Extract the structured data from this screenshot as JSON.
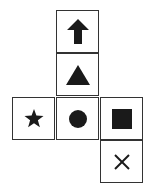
{
  "diagram": {
    "type": "cube-net",
    "cells": [
      {
        "row": 0,
        "col": 1,
        "symbol": "up-arrow"
      },
      {
        "row": 1,
        "col": 1,
        "symbol": "triangle"
      },
      {
        "row": 2,
        "col": 0,
        "symbol": "star"
      },
      {
        "row": 2,
        "col": 1,
        "symbol": "circle"
      },
      {
        "row": 2,
        "col": 2,
        "symbol": "square"
      },
      {
        "row": 3,
        "col": 2,
        "symbol": "cross"
      }
    ],
    "colors": {
      "symbol": "#1a1a1a",
      "border": "#333333",
      "background": "#ffffff"
    }
  }
}
